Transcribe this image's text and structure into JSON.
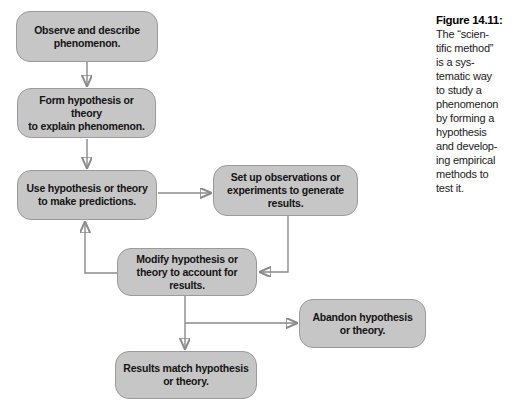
{
  "caption": {
    "title": "Figure 14.11:",
    "body": "The “scien-\ntific method”\nis a sys-\ntematic way\nto study a\nphenomenon\nby forming a\nhypothesis\nand develop-\ning empirical\nmethods to\ntest it."
  },
  "boxes": {
    "observe": {
      "label": "Observe and describe\nphenomenon."
    },
    "form": {
      "label": "Form hypothesis or theory\nto explain phenomenon."
    },
    "use": {
      "label": "Use hypothesis or theory\nto make predictions."
    },
    "setup": {
      "label": "Set up observations or\nexperiments to generate\nresults."
    },
    "modify": {
      "label": "Modify hypothesis or\ntheory to account for\nresults."
    },
    "abandon": {
      "label": "Abandon hypothesis\nor theory."
    },
    "match": {
      "label": "Results match hypothesis\nor theory."
    }
  },
  "colors": {
    "box_fill": "#c6c6c6",
    "box_border": "#9a9a9a",
    "arrow": "#8a8a8a",
    "text": "#141414",
    "background": "#ffffff"
  }
}
